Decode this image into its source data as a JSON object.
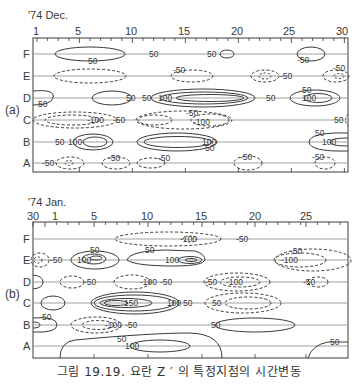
{
  "figure": {
    "caption": "그림 19.19. 요란 Z ′ 의 특정지점의 시간변동",
    "panels": [
      {
        "id": "a",
        "tag": "(a)",
        "period": "'74 Dec.",
        "x_ticks": [
          "1",
          "5",
          "10",
          "15",
          "20",
          "25",
          "30"
        ],
        "rows": [
          "F",
          "E",
          "D",
          "C",
          "B",
          "A"
        ]
      },
      {
        "id": "b",
        "tag": "(b)",
        "period": "'74 Jan.",
        "x_ticks": [
          "30",
          "1",
          "5",
          "10",
          "15",
          "20",
          "25"
        ],
        "rows": [
          "F",
          "E",
          "D",
          "C",
          "B",
          "A"
        ]
      }
    ],
    "contour_labels": {
      "p50": "50",
      "p100": "100",
      "p150": "150",
      "n50": "-50",
      "n100": "-100"
    },
    "legend_note": "solid = positive anomaly, dashed = negative anomaly"
  },
  "colors": {
    "line": "#3a3a3a",
    "background": "#ffffff"
  }
}
